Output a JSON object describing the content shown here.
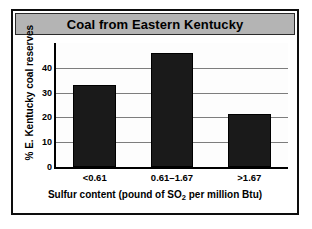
{
  "chart_data": {
    "type": "bar",
    "title": "Coal from Eastern Kentucky",
    "categories": [
      "<0.61",
      "0.61–1.67",
      ">1.67"
    ],
    "values": [
      33,
      46,
      21.5
    ],
    "xlabel_parts": {
      "before": "Sulfur content (pound of SO",
      "sub": "2",
      "after": " per million Btu)"
    },
    "xlabel": "Sulfur content (pound of SO2 per million Btu)",
    "ylabel": "% E. Kentucky coal reserves",
    "ytick_labels": [
      "0",
      "10",
      "20",
      "30",
      "40"
    ],
    "ytick_values": [
      0,
      10,
      20,
      30,
      40
    ],
    "ylim": [
      0,
      50
    ],
    "grid": true,
    "legend": false,
    "bar_color": "#1a1a1a",
    "title_banner_color": "#b4b4b4",
    "frame_color": "#0d0d0d",
    "gridline_color": "#7d7d7d"
  }
}
